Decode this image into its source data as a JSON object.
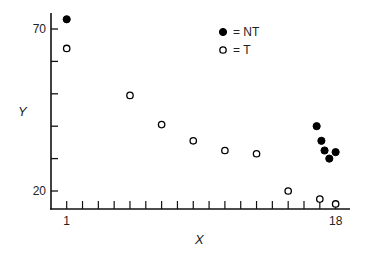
{
  "chart_data": {
    "type": "scatter",
    "title": "",
    "xlabel": "X",
    "ylabel": "Y",
    "xlim": [
      0,
      19
    ],
    "ylim": [
      15,
      75
    ],
    "x_ticks": [
      1,
      2,
      3,
      4,
      5,
      6,
      7,
      8,
      9,
      10,
      11,
      12,
      13,
      14,
      15,
      16,
      17,
      18
    ],
    "x_tick_labels": [
      {
        "value": 1,
        "label": "1"
      },
      {
        "value": 18,
        "label": "18"
      }
    ],
    "y_ticks": [
      20,
      30,
      40,
      50,
      60,
      70
    ],
    "y_tick_labels": [
      {
        "value": 70,
        "label": "70"
      },
      {
        "value": 20,
        "label": "20"
      }
    ],
    "grid": false,
    "legend_position": "upper right",
    "series": [
      {
        "name": "NT",
        "legend_label": "= NT",
        "marker": "filled-circle",
        "color": "#000000",
        "points": [
          {
            "x": 1,
            "y": 73
          },
          {
            "x": 16.8,
            "y": 40
          },
          {
            "x": 17.1,
            "y": 35.5
          },
          {
            "x": 17.3,
            "y": 32.5
          },
          {
            "x": 17.6,
            "y": 30
          },
          {
            "x": 18,
            "y": 32
          }
        ]
      },
      {
        "name": "T",
        "legend_label": "= T",
        "marker": "open-circle",
        "color": "#000000",
        "points": [
          {
            "x": 1,
            "y": 64
          },
          {
            "x": 5,
            "y": 49.5
          },
          {
            "x": 7,
            "y": 40.5
          },
          {
            "x": 9,
            "y": 35.5
          },
          {
            "x": 11,
            "y": 32.5
          },
          {
            "x": 13,
            "y": 31.5
          },
          {
            "x": 15,
            "y": 20
          },
          {
            "x": 17,
            "y": 17.5
          },
          {
            "x": 18,
            "y": 16
          }
        ]
      }
    ]
  }
}
